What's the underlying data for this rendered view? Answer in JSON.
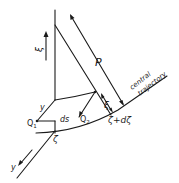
{
  "diagram": {
    "type": "physics-geometry",
    "labels": {
      "xi_axis": "ξ",
      "P": "P",
      "central": "central",
      "trajectory": "trajectory",
      "xi_small": "ξ",
      "y_upper": "y",
      "Q1": "Q",
      "Q1_sub": "1",
      "ds": "ds",
      "Q2": "Q",
      "Q2_sub": "2",
      "zeta": "ζ",
      "zeta_dzeta": "ζ+dζ",
      "y_lower": "y"
    },
    "colors": {
      "ink": "#1a1a1a",
      "background": "#ffffff"
    }
  }
}
